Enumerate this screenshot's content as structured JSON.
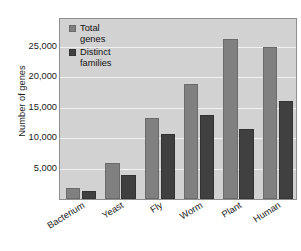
{
  "chart_data": {
    "type": "bar",
    "title": "",
    "subtitle": "",
    "xlabel": "",
    "ylabel": "Number of genes",
    "categories": [
      "Bacterium",
      "Yeast",
      "Fly",
      "Worm",
      "Plant",
      "Human"
    ],
    "series": [
      {
        "name": "Total\ngenes",
        "legend_label": "Total genes",
        "color": "#808080",
        "values": [
          1800,
          6000,
          13400,
          19000,
          26300,
          25000
        ]
      },
      {
        "name": "Distinct\nfamilies",
        "legend_label": "Distinct families",
        "color": "#404040",
        "values": [
          1400,
          4000,
          10700,
          13900,
          11600,
          16200
        ]
      }
    ],
    "ylim": [
      0,
      29600
    ],
    "yticks": [
      5000,
      10000,
      15000,
      20000,
      25000
    ],
    "ytick_labels": [
      "5,000",
      "10,000",
      "15,000",
      "20,000",
      "25,000"
    ],
    "grid": true,
    "grid_color": "#f2f2f2",
    "legend_position": "top-left-inside",
    "plot_background": "#d2d2d2",
    "figure_background": "#ffffff",
    "xtick_rotation": -32
  }
}
